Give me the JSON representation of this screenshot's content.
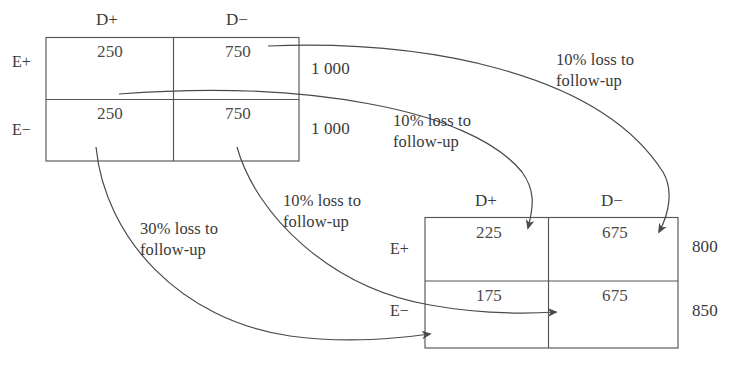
{
  "diagram": {
    "ink_color": "#3a3a3a",
    "line_color": "#555555",
    "background": "#ffffff"
  },
  "initial_table": {
    "name": "initial-cohort-table",
    "col_headers": [
      "D+",
      "D−"
    ],
    "row_headers": [
      "E+",
      "E−"
    ],
    "rows": [
      {
        "label": "E+",
        "cells": [
          "250",
          "750"
        ],
        "total": "1 000"
      },
      {
        "label": "E−",
        "cells": [
          "250",
          "750"
        ],
        "total": "1 000"
      }
    ]
  },
  "final_table": {
    "name": "after-loss-table",
    "col_headers": [
      "D+",
      "D−"
    ],
    "row_headers": [
      "E+",
      "E−"
    ],
    "rows": [
      {
        "label": "E+",
        "cells": [
          "225",
          "675"
        ],
        "total": "800"
      },
      {
        "label": "E−",
        "cells": [
          "175",
          "675"
        ],
        "total": "850"
      }
    ]
  },
  "annotations": [
    {
      "id": "loss-ep-dminus",
      "pct": "10% loss to",
      "cont": "follow-up",
      "from": "E+ D− (750)",
      "to": "E+ D− (675)"
    },
    {
      "id": "loss-ep-dplus",
      "pct": "10% loss to",
      "cont": "follow-up",
      "from": "E+ D+ (250)",
      "to": "E+ D+ (225)"
    },
    {
      "id": "loss-em-dminus",
      "pct": "10% loss to",
      "cont": "follow-up",
      "from": "E− D− (750)",
      "to": "E− D− (675)"
    },
    {
      "id": "loss-em-dplus",
      "pct": "30% loss to",
      "cont": "follow-up",
      "from": "E− D+ (250)",
      "to": "E− D+ (175)"
    }
  ]
}
